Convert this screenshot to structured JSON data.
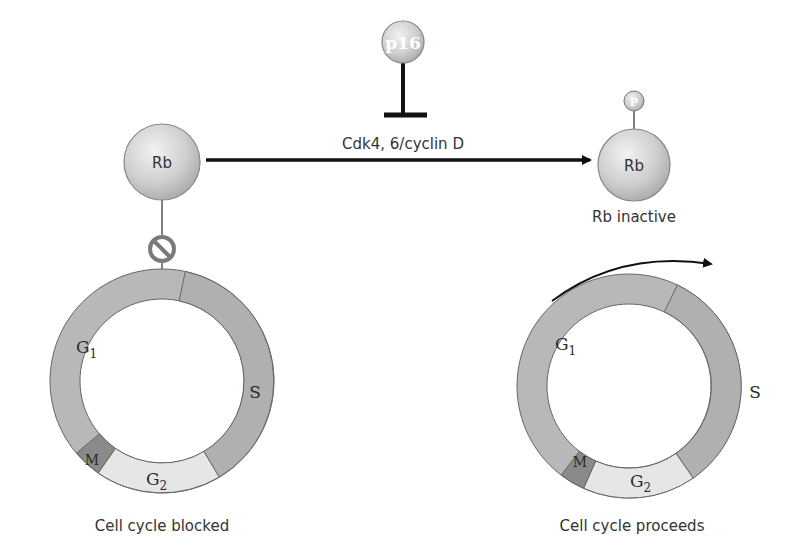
{
  "diagram": {
    "inhibitor": {
      "label": "p16"
    },
    "kinase": {
      "label": "Cdk4, 6/cyclin D"
    },
    "rb_active": {
      "label": "Rb"
    },
    "rb_inactive": {
      "label": "Rb",
      "caption": "Rb inactive",
      "phosphate_label": "P"
    },
    "cycle_blocked": {
      "caption": "Cell cycle blocked",
      "phases": {
        "g1": "G",
        "g1_sub": "1",
        "s": "S",
        "g2": "G",
        "g2_sub": "2",
        "m": "M"
      }
    },
    "cycle_proceeds": {
      "caption": "Cell cycle proceeds",
      "phases": {
        "g1": "G",
        "g1_sub": "1",
        "s": "S",
        "g2": "G",
        "g2_sub": "2",
        "m": "M"
      }
    },
    "colors": {
      "ring": "#b8b8b8",
      "s_phase": "#b0b0b0",
      "g2_phase": "#e6e6e6",
      "m_phase": "#8a8a8a",
      "block_symbol": "#7a7a7a",
      "arrow": "#111111"
    }
  }
}
